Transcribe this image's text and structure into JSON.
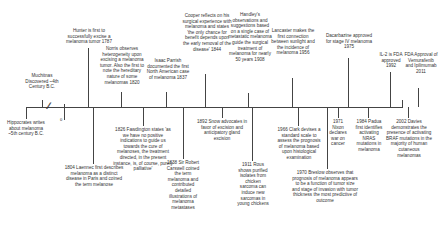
{
  "diagram": {
    "type": "timeline",
    "axis_break_symbol": "//",
    "zero_marker": "0",
    "events_above": [
      {
        "id": "muchitnas",
        "year": "4th Century B.C.",
        "text": "Muchitnas Discovered ~4th Century B.C.",
        "x": 42,
        "stem_top": 100,
        "label_left": 22,
        "label_top": 73,
        "label_width": 40
      },
      {
        "id": "hunter",
        "year": "1787",
        "text": "Hunter is first to successfully excise a melanoma tumor 1787",
        "x": 88,
        "stem_top": 48,
        "label_left": 62,
        "label_top": 28,
        "label_width": 54
      },
      {
        "id": "norris",
        "year": "1820",
        "text": "Norris observes heterogeneity upon excising a melanoma tumor. Also the first to note the hereditary nature of some melanomas 1820",
        "x": 121,
        "stem_top": 92,
        "label_left": 96,
        "label_top": 46,
        "label_width": 52
      },
      {
        "id": "parrish",
        "year": "1837",
        "text": "Isaac Parrish documented the first North American case of melanoma 1837",
        "x": 166,
        "stem_top": 92,
        "label_left": 146,
        "label_top": 58,
        "label_width": 44
      },
      {
        "id": "cooper",
        "year": "1844",
        "text": "Cooper reflects on his surgical experience with melanoma and states 'the only chance for benefit depends upon the early removal of the disease' 1844",
        "x": 205,
        "stem_top": 74,
        "label_left": 182,
        "label_top": 13,
        "label_width": 50
      },
      {
        "id": "handley",
        "year": "1908",
        "text": "Handley's observations and suggestions based on a single case of metastatic melanoma guide the surgical treatment of melanoma for nearly 50 years 1908",
        "x": 248,
        "stem_top": 93,
        "label_left": 228,
        "label_top": 12,
        "label_width": 44
      },
      {
        "id": "lancaster",
        "year": "1956",
        "text": "Lancaster makes the first connection between sunlight and the incidence of melanoma 1956",
        "x": 292,
        "stem_top": 78,
        "label_left": 270,
        "label_top": 28,
        "label_width": 46
      },
      {
        "id": "dacarbazine",
        "year": "1975",
        "text": "Dacarbazine approved for stage IV melanoma 1975",
        "x": 348,
        "stem_top": 58,
        "label_left": 324,
        "label_top": 33,
        "label_width": 50
      },
      {
        "id": "il2",
        "year": "1992",
        "text": "IL-2 is FDA approved 1992",
        "x": 390,
        "stem_top": 72,
        "label_left": 376,
        "label_top": 52,
        "label_width": 30
      },
      {
        "id": "fda2011",
        "year": "2011",
        "text": "FDA Approval of Vemurafenib and Ipilimumab 2011",
        "x": 418,
        "stem_top": 88,
        "label_left": 404,
        "label_top": 52,
        "label_width": 34
      }
    ],
    "events_below": [
      {
        "id": "hippocrates",
        "year": "5th century B.C.",
        "text": "Hippocrates writes about melanoma ~5th century B.C.",
        "x": 26,
        "stem_bottom": 120,
        "label_left": 6,
        "label_top": 120,
        "label_width": 40
      },
      {
        "id": "laennec",
        "year": "1804",
        "text": "1804 Laennec first describes melanoma as a distinct disease in Paris and coined the term melanose",
        "x": 93,
        "stem_bottom": 165,
        "label_left": 63,
        "label_top": 165,
        "label_width": 62
      },
      {
        "id": "fawdington",
        "year": "1826",
        "text": "1826 Fawdington states 'as we have no positive indications to guide us towards the cure of melanoses, the treatment directed, in the present instance, is, of course, purely palliative'",
        "x": 143,
        "stem_bottom": 127,
        "label_left": 112,
        "label_top": 127,
        "label_width": 62
      },
      {
        "id": "carswell",
        "year": "1838",
        "text": "1838 Sir Robert Carswell coined the term melanoma and contributed detailed illustrations of melanoma metastases",
        "x": 183,
        "stem_bottom": 160,
        "label_left": 166,
        "label_top": 160,
        "label_width": 34
      },
      {
        "id": "snow",
        "year": "1892",
        "text": "1892 Snow advocates in favor of excision and anticipatory gland excision",
        "x": 222,
        "stem_bottom": 119,
        "label_left": 196,
        "label_top": 119,
        "label_width": 52
      },
      {
        "id": "rous",
        "year": "1911",
        "text": "1911 Rous shows purified isolates from chicken sarcoma can induce new sarcomas in young chickens",
        "x": 252,
        "stem_bottom": 162,
        "label_left": 236,
        "label_top": 162,
        "label_width": 34
      },
      {
        "id": "clark",
        "year": "1966",
        "text": "1966 Clark devises a standard scale to assess the prognosis of melanoma based upon histological examination",
        "x": 298,
        "stem_bottom": 127,
        "label_left": 276,
        "label_top": 127,
        "label_width": 46
      },
      {
        "id": "breslow",
        "year": "1970",
        "text": "1970 Breslow observes that prognosis of melanoma appears to be a function of tumor size and stage of invasion with tumor thickness the most predictive of outcome",
        "x": 327,
        "stem_bottom": 170,
        "label_left": 292,
        "label_top": 170,
        "label_width": 66
      },
      {
        "id": "nixon",
        "year": "1971",
        "text": "1971 Nixon declares war on cancer",
        "x": 338,
        "stem_bottom": 119,
        "label_left": 328,
        "label_top": 119,
        "label_width": 20
      },
      {
        "id": "padua",
        "year": "1984",
        "text": "1984 Padua first identifies activating NRAS mutations in melanoma",
        "x": 368,
        "stem_bottom": 119,
        "label_left": 355,
        "label_top": 119,
        "label_width": 28
      },
      {
        "id": "davies",
        "year": "2002",
        "text": "2002 Davies demonstrates the presence of activating BRAF mutations in the majority of human cutaneous melanomas",
        "x": 408,
        "stem_bottom": 119,
        "label_left": 386,
        "label_top": 119,
        "label_width": 46
      }
    ]
  }
}
